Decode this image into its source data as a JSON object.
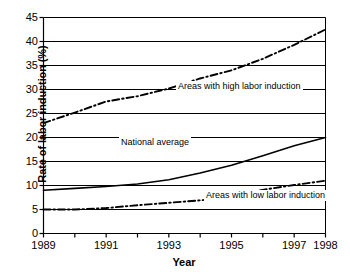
{
  "chart_data": {
    "type": "line",
    "title": "",
    "xlabel": "Year",
    "ylabel": "Rate of labor induction (%)",
    "xlim": [
      1989,
      1998
    ],
    "ylim": [
      0,
      45
    ],
    "ytick_values": [
      0,
      5,
      10,
      15,
      20,
      25,
      30,
      35,
      40,
      45
    ],
    "ytick_labels": [
      "0",
      "5",
      "10",
      "15",
      "20",
      "25",
      "30",
      "35",
      "40",
      "45"
    ],
    "xtick_values": [
      1989,
      1990,
      1991,
      1992,
      1993,
      1994,
      1995,
      1996,
      1997,
      1998
    ],
    "xtick_labels": [
      "1989",
      "",
      "1991",
      "",
      "1993",
      "",
      "1995",
      "",
      "1997",
      "1998"
    ],
    "x": [
      1989,
      1990,
      1991,
      1992,
      1993,
      1994,
      1995,
      1996,
      1997,
      1998
    ],
    "grid": "horizontal",
    "legend": "inline-annotations",
    "series": [
      {
        "name": "Areas with high labor induction",
        "style": "dash-dot",
        "color": "#000000",
        "values": [
          23.0,
          25.2,
          27.5,
          28.6,
          30.2,
          32.3,
          34.0,
          36.4,
          39.3,
          42.5
        ]
      },
      {
        "name": "National average",
        "style": "solid",
        "color": "#000000",
        "values": [
          9.0,
          9.4,
          9.8,
          10.3,
          11.2,
          12.6,
          14.2,
          16.2,
          18.3,
          20.0
        ]
      },
      {
        "name": "Areas with low labor induction",
        "style": "dash-dot",
        "color": "#000000",
        "values": [
          5.0,
          5.0,
          5.3,
          5.9,
          6.4,
          6.9,
          7.6,
          9.1,
          10.1,
          11.0
        ]
      }
    ],
    "annotations": [
      {
        "text": "Areas with high labor induction",
        "x": 1992.4,
        "y": 31.5
      },
      {
        "text": "National average",
        "x": 1990.6,
        "y": 20.0
      },
      {
        "text": "Areas with low labor induction",
        "x": 1994.2,
        "y": 8.5
      }
    ]
  },
  "axis": {
    "y_title": "Rate of labor induction (%)",
    "x_title": "Year"
  },
  "colors": {
    "axis": "#000000",
    "grid": "#000000",
    "background": "#ffffff"
  }
}
